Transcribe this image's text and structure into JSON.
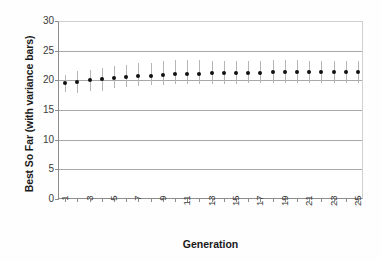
{
  "chart_data": {
    "type": "scatter",
    "title": "",
    "xlabel": "Generation",
    "ylabel": "Best So Far (with variance bars)",
    "xlim": [
      0.5,
      25.5
    ],
    "ylim": [
      0,
      30
    ],
    "yticks": [
      0,
      5,
      10,
      15,
      20,
      25,
      30
    ],
    "xticks": [
      1,
      3,
      5,
      7,
      9,
      11,
      13,
      15,
      17,
      19,
      21,
      23,
      25
    ],
    "xtick_labels": [
      "1",
      "3",
      "5",
      "7",
      "9",
      "11",
      "13",
      "15",
      "17",
      "19",
      "21",
      "23",
      "25"
    ],
    "xtick_rotation": 90,
    "grid": "horizontal",
    "legend": "none",
    "marker": "filled-circle",
    "errorbar_color": "#b5b5b5",
    "marker_color": "#111111",
    "series": [
      {
        "name": "Best So Far",
        "x": [
          1,
          2,
          3,
          4,
          5,
          6,
          7,
          8,
          9,
          10,
          11,
          12,
          13,
          14,
          15,
          16,
          17,
          18,
          19,
          20,
          21,
          22,
          23,
          24,
          25
        ],
        "values": [
          19.5,
          19.8,
          20.0,
          20.15,
          20.35,
          20.55,
          20.7,
          20.8,
          20.9,
          21.05,
          21.1,
          21.1,
          21.25,
          21.25,
          21.25,
          21.3,
          21.3,
          21.35,
          21.35,
          21.35,
          21.4,
          21.4,
          21.4,
          21.4,
          21.4
        ],
        "err_low": [
          1.5,
          1.9,
          1.8,
          1.9,
          1.7,
          1.6,
          1.7,
          1.6,
          1.7,
          1.7,
          1.7,
          1.7,
          1.8,
          1.8,
          1.8,
          1.8,
          1.8,
          1.8,
          1.8,
          1.8,
          1.9,
          1.9,
          1.9,
          1.9,
          1.9
        ],
        "err_high": [
          1.4,
          1.7,
          1.8,
          1.9,
          2.0,
          2.1,
          2.2,
          2.2,
          2.3,
          2.4,
          2.4,
          2.4,
          2.0,
          2.0,
          2.0,
          2.0,
          2.0,
          2.0,
          2.0,
          2.0,
          1.9,
          1.9,
          1.9,
          1.9,
          1.9
        ]
      }
    ]
  },
  "axes": {
    "y_title": "Best So Far (with variance bars)",
    "x_title": "Generation"
  }
}
